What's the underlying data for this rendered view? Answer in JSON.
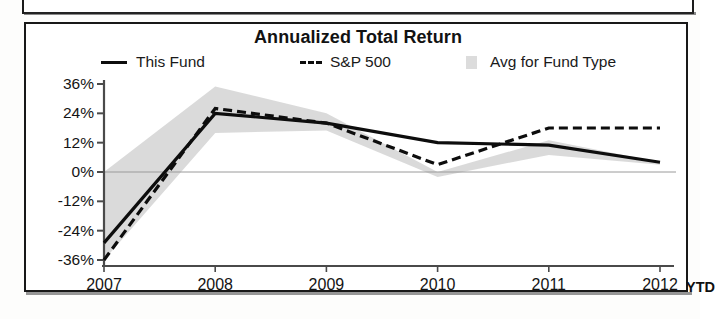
{
  "document": {
    "upper_panel_present": true
  },
  "chart_card": {
    "title": "Annualized Total Return",
    "ytd_marker": "YTD"
  },
  "legend": {
    "position": "top",
    "items": [
      {
        "label": "This Fund",
        "marker": "solid-line-swatch",
        "color": "#0d0d0d"
      },
      {
        "label": "S&P 500",
        "marker": "dashed-line-swatch",
        "color": "#0d0d0d"
      },
      {
        "label": "Avg for Fund Type",
        "marker": "area-swatch",
        "color": "#d6d6d6"
      }
    ]
  },
  "colors": {
    "this_fund": "#0d0d0d",
    "sp500": "#0d0d0d",
    "avg_band": "#d6d6d6",
    "axis": "#4a4a4a",
    "text": "#141414",
    "frame": "#181818"
  },
  "chart_data": {
    "type": "line",
    "title": "Annualized Total Return",
    "xlabel": "",
    "ylabel": "",
    "x": [
      "2007",
      "2008",
      "2009",
      "2010",
      "2011",
      "2012"
    ],
    "categories": [
      "2007",
      "2008",
      "2009",
      "2010",
      "2011",
      "2012"
    ],
    "xtick_labels": [
      "2007",
      "2008",
      "2009",
      "2010",
      "2011",
      "2012"
    ],
    "ytick_labels": [
      "36%",
      "24%",
      "12%",
      "0%",
      "-12%",
      "-24%",
      "-36%"
    ],
    "ytick_values": [
      36,
      24,
      12,
      0,
      -12,
      -24,
      -36
    ],
    "ylim": [
      -36,
      36
    ],
    "grid": false,
    "legend_position": "top",
    "annotations": [
      "YTD"
    ],
    "series": [
      {
        "name": "This Fund",
        "style": "solid",
        "color": "#0d0d0d",
        "values": [
          -29,
          24,
          20,
          12,
          11,
          4
        ]
      },
      {
        "name": "S&P 500",
        "style": "dashed",
        "color": "#0d0d0d",
        "values": [
          -36,
          26,
          20,
          3,
          18,
          18
        ]
      },
      {
        "name": "Avg for Fund Type",
        "style": "area-band",
        "color": "#d6d6d6",
        "upper": [
          0,
          35,
          24,
          0,
          13,
          4
        ],
        "lower": [
          -36,
          16,
          17,
          -2,
          7,
          3
        ]
      }
    ]
  }
}
